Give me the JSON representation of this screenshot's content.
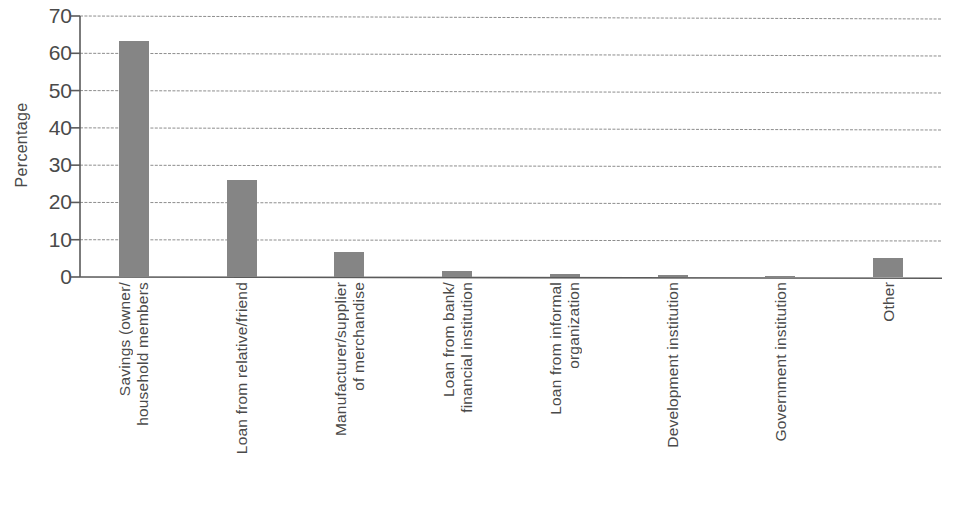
{
  "chart_data": {
    "type": "bar",
    "title": "",
    "subtitle": "",
    "xlabel": "",
    "ylabel": "Percentage",
    "ylim": [
      0,
      70
    ],
    "yticks": [
      0,
      10,
      20,
      30,
      40,
      50,
      60,
      70
    ],
    "grid": "horizontal",
    "legend": "none",
    "orientation": "vertical",
    "bar_color": "#858585",
    "axis_color": "#4a4a4a",
    "categories": [
      "Savings (owner/household members",
      "Loan from relative/friend",
      "Manufacturer/supplier of merchandise",
      "Loan from bank/financial institution",
      "Loan from informal organization",
      "Development institution",
      "Government institution",
      "Other"
    ],
    "category_lines": [
      [
        "Savings (owner/",
        "household members"
      ],
      [
        "Loan from relative/friend"
      ],
      [
        "Manufacturer/supplier",
        "of merchandise"
      ],
      [
        "Loan from bank/",
        "financial institution"
      ],
      [
        "Loan from informal",
        "organization"
      ],
      [
        "Development institution"
      ],
      [
        "Government institution"
      ],
      [
        "Other"
      ]
    ],
    "values": [
      63.3,
      26.0,
      6.8,
      1.5,
      0.7,
      0.5,
      0.3,
      5.2
    ]
  }
}
